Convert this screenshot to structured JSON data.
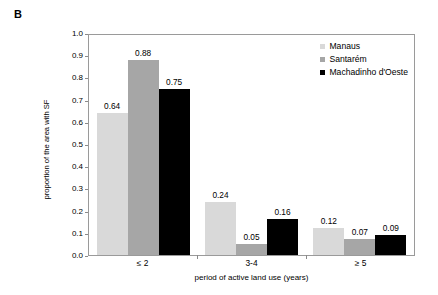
{
  "panel": {
    "label": "B"
  },
  "chart_data": {
    "type": "bar",
    "title": "",
    "subtitle": "",
    "panel_label": "B",
    "categories": [
      "≤ 2",
      "3-4",
      "≥ 5"
    ],
    "series": [
      {
        "name": "Manaus",
        "color": "#d9d9d9",
        "values": [
          0.64,
          0.24,
          0.12
        ],
        "labels": [
          "0.64",
          "0.24",
          "0.12"
        ]
      },
      {
        "name": "Santarém",
        "color": "#a6a6a6",
        "values": [
          0.88,
          0.05,
          0.07
        ],
        "labels": [
          "0.88",
          "0.05",
          "0.07"
        ]
      },
      {
        "name": "Machadinho d'Oeste",
        "color": "#000000",
        "values": [
          0.75,
          0.16,
          0.09
        ],
        "labels": [
          "0.75",
          "0.16",
          "0.09"
        ]
      }
    ],
    "xlabel": "period of active land use (years)",
    "ylabel": "proportion of the area with SF",
    "ylim": [
      0.0,
      1.0
    ],
    "ytick_values": [
      1.0,
      0.9,
      0.8,
      0.7,
      0.6,
      0.5,
      0.4,
      0.3,
      0.2,
      0.1,
      0.0
    ],
    "ytick_labels": [
      "1.0",
      "0.9",
      "0.8",
      "0.7",
      "0.6",
      "0.5",
      "0.4",
      "0.3",
      "0.2",
      "0.1",
      "0.0"
    ],
    "grid": false,
    "legend_position": "top-right-inside",
    "frame": "full-box"
  }
}
